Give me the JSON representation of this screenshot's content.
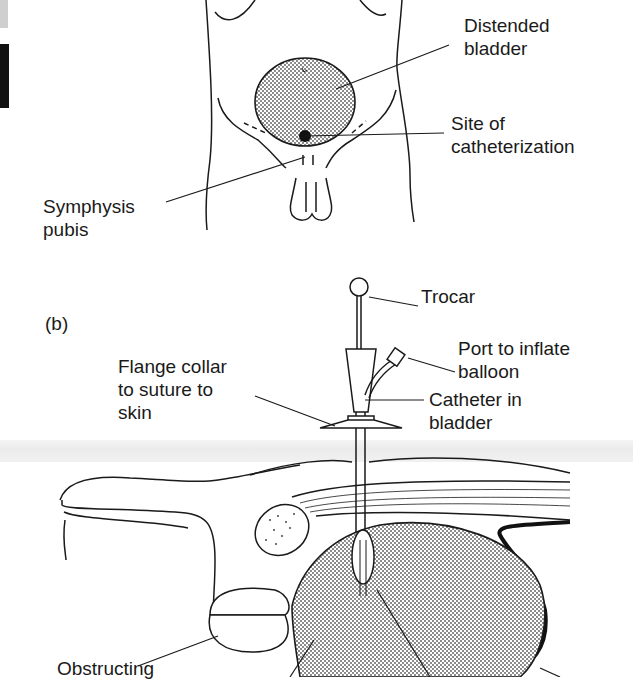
{
  "figure": {
    "panel_a": {
      "labels": {
        "distended_bladder": [
          "Distended",
          "bladder"
        ],
        "site_of_catheterization": [
          "Site of",
          "catheterization"
        ],
        "symphysis_pubis": [
          "Symphysis",
          "pubis"
        ]
      }
    },
    "panel_b": {
      "panel_letter": "(b)",
      "labels": {
        "trocar": [
          "Trocar"
        ],
        "port_to_inflate_balloon": [
          "Port to inflate",
          "balloon"
        ],
        "flange_collar": [
          "Flange collar",
          "to suture to",
          "skin"
        ],
        "catheter_in_bladder": [
          "Catheter in",
          "bladder"
        ],
        "obstructing": [
          "Obstructing"
        ]
      }
    },
    "colors": {
      "ink": "#1a1a1a",
      "stipple": "#555555",
      "background": "#ffffff"
    }
  }
}
